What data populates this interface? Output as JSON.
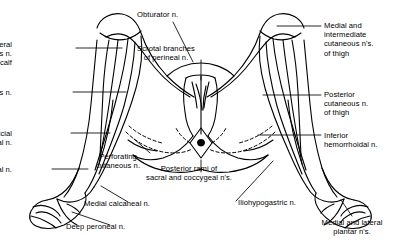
{
  "figure": {
    "background_color": "#ffffff",
    "line_color": "#000000",
    "text_color": "#000000"
  },
  "labels": [
    {
      "id": "obturator",
      "name": "label-obturator-nerve",
      "text": "Obturator n.",
      "align": "left",
      "x": 137,
      "y": 10
    },
    {
      "id": "lateral-cutaneous-calf",
      "name": "label-lateral-cutaneous-nerve-of-calf",
      "text": "Lateral\ncutaneous n.\nof calf",
      "align": "right",
      "x": 12,
      "y": 40
    },
    {
      "id": "scrotal-branches",
      "name": "label-scrotal-branches-of-perineal-nerve",
      "text": "Scrotal branches\nof perineal n.",
      "align": "center",
      "x": 166,
      "y": 44
    },
    {
      "id": "medial-intermediate-thigh",
      "name": "label-medial-and-intermediate-cutaneous-nerves-of-thigh",
      "text": "Medial and\nintermediate\ncutaneous n's.\nof thigh",
      "align": "left",
      "x": 324,
      "y": 21
    },
    {
      "id": "saphenous",
      "name": "label-saphenous-nerve",
      "text": "Saphenous n.",
      "align": "right",
      "x": 12,
      "y": 88
    },
    {
      "id": "posterior-cutaneous-thigh",
      "name": "label-posterior-cutaneous-nerve-of-thigh",
      "text": "Posterior\ncutaneous n.\nof thigh",
      "align": "left",
      "x": 324,
      "y": 90
    },
    {
      "id": "superficial-peroneal",
      "name": "label-superficial-peroneal-nerve",
      "text": "Superficial\nperoneal n.",
      "align": "right",
      "x": 12,
      "y": 129
    },
    {
      "id": "inferior-hemorrhoidal",
      "name": "label-inferior-hemorrhoidal-nerve",
      "text": "Inferior\nhemorrhoidal n.",
      "align": "left",
      "x": 324,
      "y": 131
    },
    {
      "id": "perforating-cutaneous",
      "name": "label-perforating-cutaneous-nerve",
      "text": "Perforating\ncutaneous n.",
      "align": "center",
      "x": 118,
      "y": 152
    },
    {
      "id": "sural",
      "name": "label-sural-nerve",
      "text": "Sural n.",
      "align": "right",
      "x": 12,
      "y": 165
    },
    {
      "id": "posterior-rami",
      "name": "label-posterior-rami-of-sacral-and-coccygeal-nerves",
      "text": "Posterior rami of\nsacral and coccygeal n's.",
      "align": "center",
      "x": 189,
      "y": 164
    },
    {
      "id": "medial-calcaneal",
      "name": "label-medial-calcaneal-nerve",
      "text": "Medial calcaneal n.",
      "align": "left",
      "x": 84,
      "y": 199
    },
    {
      "id": "iliohypogastric",
      "name": "label-iliohypogastric-nerve",
      "text": "Iliohypogastric n.",
      "align": "left",
      "x": 238,
      "y": 198
    },
    {
      "id": "deep-peroneal",
      "name": "label-deep-peroneal-nerve",
      "text": "Deep peroneal n.",
      "align": "left",
      "x": 66,
      "y": 222
    },
    {
      "id": "medial-lateral-plantar",
      "name": "label-medial-and-lateral-plantar-nerves",
      "text": "Medial and lateral\nplantar n's.",
      "align": "center",
      "x": 352,
      "y": 218
    }
  ]
}
